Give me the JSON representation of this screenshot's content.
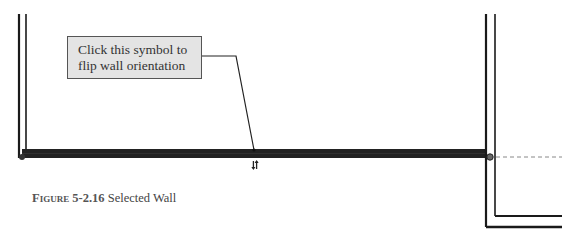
{
  "callout": {
    "line1": "Click this symbol to",
    "line2": "flip wall orientation"
  },
  "caption": {
    "label": "Figure 5-2.16",
    "text": "Selected Wall"
  },
  "colors": {
    "wall": "#1a1a1a",
    "selected_wall": "#222222",
    "callout_bg": "#e4e4e4",
    "reference_line": "#888888"
  },
  "icons": {
    "flip": "flip-orientation-arrows-icon",
    "endpoint_left": "wall-endpoint-icon",
    "endpoint_right": "wall-endpoint-icon"
  }
}
